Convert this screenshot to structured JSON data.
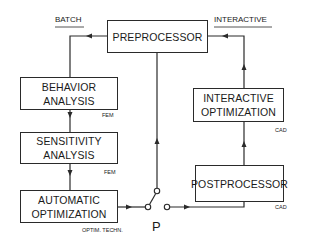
{
  "diagram": {
    "mode_labels": {
      "batch": "BATCH",
      "interactive": "INTERACTIVE"
    },
    "nodes": {
      "preprocessor": {
        "label": "PREPROCESSOR"
      },
      "behavior_analysis": {
        "label_line1": "BEHAVIOR",
        "label_line2": "ANALYSIS",
        "tag": "FEM"
      },
      "sensitivity_analysis": {
        "label_line1": "SENSITIVITY",
        "label_line2": "ANALYSIS",
        "tag": "FEM"
      },
      "automatic_optimization": {
        "label_line1": "AUTOMATIC",
        "label_line2": "OPTIMIZATION",
        "tag": "OPTIM. TECHN."
      },
      "interactive_optimization": {
        "label_line1": "INTERACTIVE",
        "label_line2": "OPTIMIZATION",
        "tag": "CAD"
      },
      "postprocessor": {
        "label": "POSTPROCESSOR",
        "tag": "CAD"
      }
    },
    "switch": {
      "label": "P"
    },
    "edges": [
      {
        "from": "preprocessor",
        "to": "behavior_analysis",
        "path": "batch"
      },
      {
        "from": "behavior_analysis",
        "to": "sensitivity_analysis"
      },
      {
        "from": "sensitivity_analysis",
        "to": "automatic_optimization"
      },
      {
        "from": "automatic_optimization",
        "to": "switch_P"
      },
      {
        "from": "switch_P",
        "to": "preprocessor"
      },
      {
        "from": "switch_P",
        "to": "postprocessor"
      },
      {
        "from": "postprocessor",
        "to": "interactive_optimization"
      },
      {
        "from": "interactive_optimization",
        "to": "preprocessor",
        "path": "interactive"
      }
    ],
    "colors": {
      "line": "#2a2a2a",
      "background": "#ffffff"
    }
  }
}
